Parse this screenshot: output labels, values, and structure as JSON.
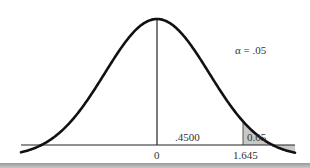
{
  "chart_data": {
    "type": "area",
    "title": "",
    "distribution": "standard normal",
    "xlabel": "",
    "ylabel": "",
    "x_ticks": [
      "0",
      "1.645"
    ],
    "mean": 0,
    "critical_value": 1.645,
    "shaded_region": {
      "from": 1.645,
      "to": "inf",
      "area": 0.05,
      "label": "0.05",
      "color": "#c8c8c8"
    },
    "middle_region": {
      "from": 0,
      "to": 1.645,
      "area": 0.45,
      "label": ".4500"
    },
    "annotations": [
      {
        "text": "α = .05"
      }
    ],
    "grid": false,
    "legend": false
  },
  "labels": {
    "alpha": "α = .05",
    "middle_area": ".4500",
    "tail_area": "0.05",
    "tick_zero": "0",
    "tick_critical": "1.645"
  },
  "colors": {
    "curve": "#111111",
    "shade": "#c8c8c8",
    "axis": "#222222"
  }
}
